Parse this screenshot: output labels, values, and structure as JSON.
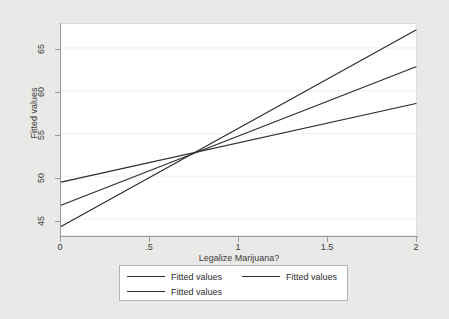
{
  "chart_data": {
    "type": "line",
    "title": "",
    "xlabel": "Legalize Marijuana?",
    "ylabel": "Fitted values",
    "xlim": [
      0,
      2
    ],
    "ylim": [
      43.0,
      67.8
    ],
    "xticks": [
      "0",
      ".5",
      "1",
      "1.5",
      "2"
    ],
    "xtick_values": [
      0,
      0.5,
      1,
      1.5,
      2
    ],
    "yticks": [
      "45",
      "50",
      "55",
      "60",
      "65"
    ],
    "ytick_values": [
      45,
      50,
      55,
      60,
      65
    ],
    "grid": true,
    "grid_axis": "y",
    "legend_position": "bottom",
    "line_color": "#2a2a2a",
    "plot_background": "#ffffff",
    "page_background": "#e9e9e7",
    "x": [
      0,
      2
    ],
    "series": [
      {
        "name": "Fitted values",
        "values": [
          49.3,
          58.5
        ],
        "slope": 4.6,
        "intercept": 49.3
      },
      {
        "name": "Fitted values",
        "values": [
          46.6,
          62.8
        ],
        "slope": 8.1,
        "intercept": 46.6
      },
      {
        "name": "Fitted values",
        "values": [
          44.1,
          67.1
        ],
        "slope": 11.5,
        "intercept": 44.1
      }
    ],
    "annotations": [
      {
        "type": "intersection",
        "x": 0.73,
        "y": 52.6,
        "label": ""
      }
    ]
  },
  "axes": {
    "y_title": "Fitted values",
    "x_title": "Legalize Marijuana?",
    "y_labels": [
      "65",
      "60",
      "55",
      "50",
      "45"
    ],
    "x_labels": [
      "0",
      ".5",
      "1",
      "1.5",
      "2"
    ]
  },
  "legend": {
    "row1": [
      {
        "label": "Fitted values"
      },
      {
        "label": "Fitted values"
      }
    ],
    "row2": [
      {
        "label": "Fitted values"
      }
    ]
  }
}
